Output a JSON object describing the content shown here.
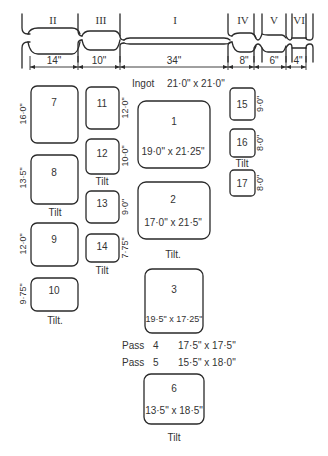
{
  "roll_profile": {
    "grooves": [
      {
        "label": "II",
        "width": "14\""
      },
      {
        "label": "III",
        "width": "10\""
      },
      {
        "label": "I",
        "width": "34\""
      },
      {
        "label": "IV",
        "width": "8\""
      },
      {
        "label": "V",
        "width": "6\""
      },
      {
        "label": "VI",
        "width": "4\""
      }
    ]
  },
  "ingot": {
    "label": "Ingot",
    "size": "21·0\" x 21·0\""
  },
  "passes": {
    "p1": {
      "num": "1",
      "size": "19·0\" x 21·25\""
    },
    "p2": {
      "num": "2",
      "size": "17·0\" x 21·5\"",
      "note": "Tilt."
    },
    "p3": {
      "num": "3",
      "size": "19·5\" x 17·25\""
    },
    "p4": {
      "label": "Pass",
      "num": "4",
      "size": "17·5\" x 17·5\""
    },
    "p5": {
      "label": "Pass",
      "num": "5",
      "size": "15·5\" x 18·0\""
    },
    "p6": {
      "num": "6",
      "size": "13·5\" x 18·5\"",
      "note": "Tilt"
    },
    "p7": {
      "num": "7",
      "dim": "16·0\""
    },
    "p8": {
      "num": "8",
      "dim": "13·5\"",
      "note": "Tilt"
    },
    "p9": {
      "num": "9",
      "dim": "12·0\""
    },
    "p10": {
      "num": "10",
      "dim": "9·75\"",
      "note": "Tilt."
    },
    "p11": {
      "num": "11",
      "dim": "12·0\""
    },
    "p12": {
      "num": "12",
      "dim": "10·0\"",
      "note": "Tilt"
    },
    "p13": {
      "num": "13",
      "dim": "9·0\""
    },
    "p14": {
      "num": "14",
      "dim": "7·75\"",
      "note": "Tilt"
    },
    "p15": {
      "num": "15",
      "dim": "9·0\""
    },
    "p16": {
      "num": "16",
      "dim": "8·0\"",
      "note": "Tilt"
    },
    "p17": {
      "num": "17",
      "dim": "8·0\""
    }
  }
}
